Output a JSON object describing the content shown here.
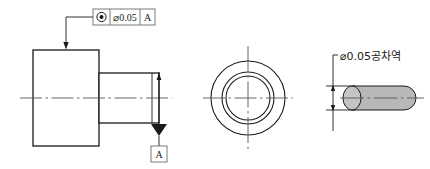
{
  "drawing": {
    "title": "Concentricity tolerance technical drawing",
    "colors": {
      "line": "#1a1a1a",
      "centerline": "#555555",
      "frame_border": "#7a7a7a",
      "tolerance_zone_fill": "#b8b8b8",
      "background": "#ffffff"
    },
    "feature_control_frame": {
      "name": "feature-control-frame",
      "symbol_name": "concentricity-icon",
      "symbol_glyph": "◎",
      "tolerance_value": "⌀0.05",
      "datum_reference": "A"
    },
    "front_view": {
      "name": "stepped-shaft-front-view",
      "centerline_name": "axis-centerline",
      "large_boss_name": "large-diameter-boss",
      "small_shaft_name": "small-diameter-shaft",
      "leader_name": "feature-control-leader",
      "datum_feature": {
        "name": "datum-feature-symbol-a",
        "label": "A"
      }
    },
    "end_view": {
      "name": "end-view-concentric-circles",
      "circle_names": [
        "outer-diameter-circle",
        "middle-diameter-circle",
        "inner-diameter-circle"
      ],
      "centerline_names": [
        "end-view-vertical-centerline",
        "end-view-horizontal-centerline"
      ]
    },
    "tolerance_zone_detail": {
      "name": "tolerance-zone-detail",
      "note": "⌀0.05공차역",
      "cylinder_name": "tolerance-zone-cylinder",
      "dimension_name": "tolerance-zone-diameter-dimension",
      "leader_name": "tolerance-zone-note-leader",
      "axis_name": "tolerance-zone-axis-centerline"
    }
  }
}
